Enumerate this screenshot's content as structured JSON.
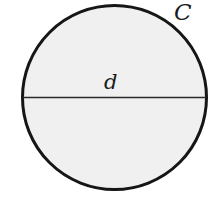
{
  "figure": {
    "background_color": "#ffffff",
    "width": 220,
    "height": 204
  },
  "labels": {
    "circumference": "C",
    "diameter": "d"
  },
  "diagram_data": {
    "type": "geometry-diagram",
    "shape": "circle",
    "circle": {
      "center_x": 114.5,
      "center_y": 97.5,
      "radius": 93.5,
      "fill_color": "#f0f0f0",
      "stroke_color": "#161616",
      "stroke_width": 3
    },
    "diameter_segment": {
      "x1": 21,
      "y1": 97.5,
      "x2": 208,
      "y2": 97.5,
      "stroke_color": "#2a2a2a",
      "stroke_width": 1.6,
      "label": "d"
    },
    "circumference_label": {
      "text": "C",
      "x": 185,
      "y": 13,
      "position": "outside-upper-right"
    }
  }
}
